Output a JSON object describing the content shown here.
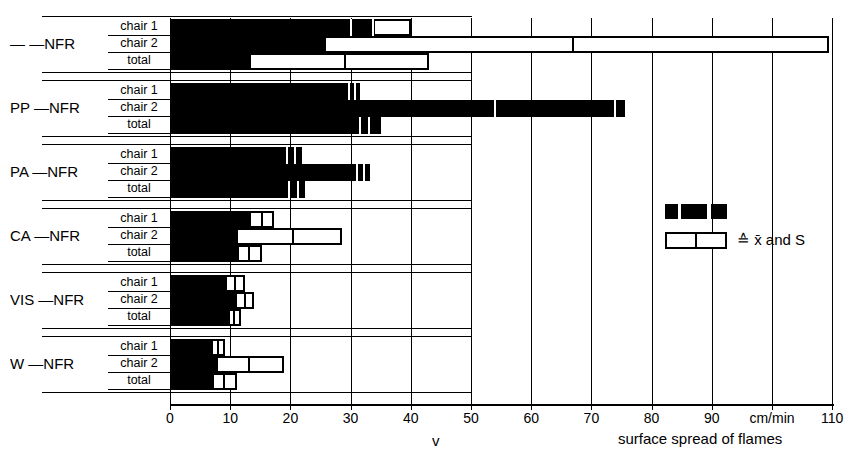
{
  "axis": {
    "unit_label": "cm/min",
    "variable_label": "v",
    "caption": "surface spread of flames",
    "ticks": [
      0,
      10,
      20,
      30,
      40,
      50,
      60,
      70,
      80,
      90,
      100,
      110
    ],
    "tick_labels": [
      "0",
      "10",
      "20",
      "30",
      "40",
      "50",
      "60",
      "70",
      "80",
      "90",
      "",
      "110"
    ]
  },
  "legend": {
    "mean_swatch_name": "mean-black-swatch",
    "sd_swatch_name": "sd-white-swatch",
    "text": "≙ x̄ and S"
  },
  "row_labels": [
    "chair 1",
    "chair 2",
    "total"
  ],
  "groups": [
    {
      "label": "—  —NFR",
      "prefix": "—",
      "suffix": "—NFR"
    },
    {
      "label": "PP  —NFR",
      "prefix": "PP",
      "suffix": "—NFR"
    },
    {
      "label": "PA  —NFR",
      "prefix": "PA",
      "suffix": "—NFR"
    },
    {
      "label": "CA —NFR",
      "prefix": "CA",
      "suffix": "—NFR"
    },
    {
      "label": "VIS —NFR",
      "prefix": "VIS",
      "suffix": "—NFR"
    },
    {
      "label": "W  —NFR",
      "prefix": "W",
      "suffix": "—NFR"
    }
  ],
  "chart_data": {
    "type": "bar",
    "orientation": "horizontal",
    "title": "",
    "xlabel": "v   surface spread of flames   [cm/min]",
    "ylabel": "",
    "xlim": [
      0,
      110
    ],
    "grid": true,
    "legend_position": "right-middle",
    "value_meaning": "black bar = mean x̄ ; white bar extension = standard deviation S",
    "categories": [
      "— —NFR",
      "PP —NFR",
      "PA —NFR",
      "CA —NFR",
      "VIS —NFR",
      "W —NFR"
    ],
    "subcategories": [
      "chair 1",
      "chair 2",
      "total"
    ],
    "series": [
      {
        "group": "— —NFR",
        "rows": [
          {
            "name": "chair 1",
            "mean": 33.7,
            "sd_end": 40.0,
            "marks": [
              30.0,
              33.7
            ]
          },
          {
            "name": "chair 2",
            "mean": 25.5,
            "sd_end": 109.5,
            "marks": [
              67.0
            ]
          },
          {
            "name": "total",
            "mean": 13.2,
            "sd_end": 43.0,
            "marks": [
              29.0
            ]
          }
        ]
      },
      {
        "group": "PP —NFR",
        "rows": [
          {
            "name": "chair 1",
            "mean": 31.5,
            "sd_end": 31.5,
            "marks": [
              29.8,
              30.8
            ]
          },
          {
            "name": "chair 2",
            "mean": 75.5,
            "sd_end": 75.5,
            "marks": [
              54.0,
              74.0
            ]
          },
          {
            "name": "total",
            "mean": 35.0,
            "sd_end": 35.0,
            "marks": [
              31.5,
              33.0
            ]
          }
        ]
      },
      {
        "group": "PA —NFR",
        "rows": [
          {
            "name": "chair 1",
            "mean": 22.0,
            "sd_end": 22.0,
            "marks": [
              19.5,
              20.8
            ]
          },
          {
            "name": "chair 2",
            "mean": 33.2,
            "sd_end": 33.2,
            "marks": [
              31.0,
              32.2
            ]
          },
          {
            "name": "total",
            "mean": 22.5,
            "sd_end": 22.5,
            "marks": [
              19.8,
              21.2
            ]
          }
        ]
      },
      {
        "group": "CA —NFR",
        "rows": [
          {
            "name": "chair 1",
            "mean": 13.2,
            "sd_end": 17.2,
            "marks": [
              15.2
            ]
          },
          {
            "name": "chair 2",
            "mean": 11.0,
            "sd_end": 28.5,
            "marks": [
              20.5
            ]
          },
          {
            "name": "total",
            "mean": 11.2,
            "sd_end": 15.2,
            "marks": [
              13.2
            ]
          }
        ]
      },
      {
        "group": "VIS —NFR",
        "rows": [
          {
            "name": "chair 1",
            "mean": 9.2,
            "sd_end": 12.4,
            "marks": [
              10.8
            ]
          },
          {
            "name": "chair 2",
            "mean": 10.8,
            "sd_end": 14.0,
            "marks": [
              12.4
            ]
          },
          {
            "name": "total",
            "mean": 9.6,
            "sd_end": 11.8,
            "marks": [
              10.7
            ]
          }
        ]
      },
      {
        "group": "W —NFR",
        "rows": [
          {
            "name": "chair 1",
            "mean": 6.8,
            "sd_end": 9.2,
            "marks": [
              8.0
            ]
          },
          {
            "name": "chair 2",
            "mean": 7.6,
            "sd_end": 19.0,
            "marks": [
              13.2
            ]
          },
          {
            "name": "total",
            "mean": 7.0,
            "sd_end": 11.2,
            "marks": [
              9.0
            ]
          }
        ]
      }
    ]
  }
}
